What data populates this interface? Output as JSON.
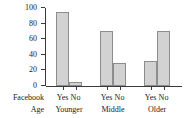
{
  "chart_data": {
    "type": "bar",
    "title": "",
    "subtitle": "",
    "xlabel": "",
    "ylabel": "Percent",
    "ylim": [
      0,
      100
    ],
    "yticks": [
      0,
      20,
      40,
      60,
      80,
      100
    ],
    "ytick_labels": [
      "0",
      "20",
      "40",
      "60",
      "80",
      "100"
    ],
    "grid": false,
    "legend": "none",
    "group_axis_labels": [
      "Facebook",
      "Age"
    ],
    "categories": [
      "Younger",
      "Middle",
      "Older"
    ],
    "subcategories": [
      "Yes",
      "No"
    ],
    "groups": [
      {
        "name": "Younger",
        "bars": [
          {
            "label": "Yes",
            "value": 95
          },
          {
            "label": "No",
            "value": 5
          }
        ]
      },
      {
        "name": "Middle",
        "bars": [
          {
            "label": "Yes",
            "value": 70
          },
          {
            "label": "No",
            "value": 30
          }
        ]
      },
      {
        "name": "Older",
        "bars": [
          {
            "label": "Yes",
            "value": 32
          },
          {
            "label": "No",
            "value": 70
          }
        ]
      }
    ],
    "series": [
      {
        "name": "Yes",
        "values": [
          95,
          70,
          32
        ]
      },
      {
        "name": "No",
        "values": [
          5,
          30,
          70
        ]
      }
    ],
    "colors": {
      "bar_fill": "#d2d2d2",
      "bar_stroke": "#8d8d8d",
      "axis": "#3a3a3a",
      "text": "#1a1a1a",
      "background": "#ffffff"
    }
  }
}
